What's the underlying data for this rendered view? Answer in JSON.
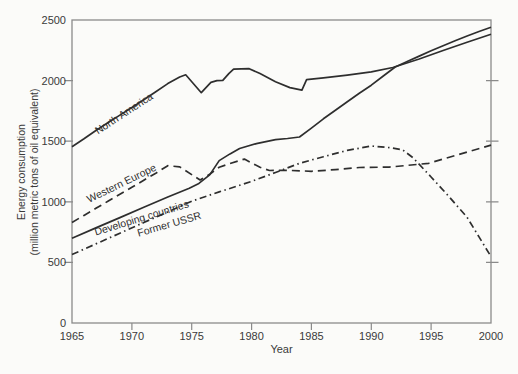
{
  "figure": {
    "background": "#fbfbf9",
    "axis_color": "#8a8a8a",
    "line_color": "#2e2e2e",
    "text_color": "#3a3a3a"
  },
  "chart_data": {
    "type": "line",
    "title": "",
    "xlabel": "Year",
    "ylabel_line1": "Energy consumption",
    "ylabel_line2": "(million metric tons of oil equivalent)",
    "xlim": [
      1965,
      2000
    ],
    "ylim": [
      0,
      2500
    ],
    "x_ticks": [
      1965,
      1970,
      1975,
      1980,
      1985,
      1990,
      1995,
      2000
    ],
    "y_ticks": [
      0,
      500,
      1000,
      1500,
      2000,
      2500
    ],
    "grid": false,
    "legend": "inline-rotated-labels",
    "series": [
      {
        "name": "North America",
        "style": "solid",
        "points": [
          [
            1965,
            1455
          ],
          [
            1966,
            1520
          ],
          [
            1967,
            1588
          ],
          [
            1968,
            1652
          ],
          [
            1969,
            1715
          ],
          [
            1970,
            1778
          ],
          [
            1971,
            1842
          ],
          [
            1972,
            1908
          ],
          [
            1973,
            1975
          ],
          [
            1974,
            2030
          ],
          [
            1974.5,
            2048
          ],
          [
            1975.8,
            1900
          ],
          [
            1976.6,
            1985
          ],
          [
            1977.1,
            2000
          ],
          [
            1977.6,
            2002
          ],
          [
            1978.1,
            2058
          ],
          [
            1978.5,
            2095
          ],
          [
            1979.8,
            2098
          ],
          [
            1980.7,
            2058
          ],
          [
            1982,
            1990
          ],
          [
            1983.2,
            1942
          ],
          [
            1984.2,
            1922
          ],
          [
            1984.6,
            2008
          ],
          [
            1986,
            2022
          ],
          [
            1988,
            2045
          ],
          [
            1990,
            2072
          ],
          [
            1991.8,
            2108
          ],
          [
            1994,
            2178
          ],
          [
            1996,
            2248
          ],
          [
            1998,
            2316
          ],
          [
            2000,
            2382
          ]
        ]
      },
      {
        "name": "Western Europe",
        "style": "dashed",
        "points": [
          [
            1965,
            830
          ],
          [
            1966,
            888
          ],
          [
            1967,
            946
          ],
          [
            1968,
            1004
          ],
          [
            1969,
            1062
          ],
          [
            1970,
            1120
          ],
          [
            1971,
            1178
          ],
          [
            1972,
            1236
          ],
          [
            1973,
            1298
          ],
          [
            1974,
            1288
          ],
          [
            1975.7,
            1180
          ],
          [
            1976.5,
            1228
          ],
          [
            1977.3,
            1285
          ],
          [
            1978.2,
            1316
          ],
          [
            1979.4,
            1352
          ],
          [
            1980.7,
            1285
          ],
          [
            1981.5,
            1258
          ],
          [
            1983,
            1260
          ],
          [
            1985,
            1252
          ],
          [
            1987,
            1266
          ],
          [
            1989,
            1283
          ],
          [
            1991.5,
            1286
          ],
          [
            1993,
            1300
          ],
          [
            1994.8,
            1318
          ],
          [
            1997,
            1382
          ],
          [
            2000,
            1468
          ]
        ]
      },
      {
        "name": "Developing countries",
        "style": "solid",
        "points": [
          [
            1965,
            700
          ],
          [
            1967,
            785
          ],
          [
            1969,
            870
          ],
          [
            1971,
            955
          ],
          [
            1973,
            1040
          ],
          [
            1974.8,
            1112
          ],
          [
            1975.6,
            1152
          ],
          [
            1976.5,
            1222
          ],
          [
            1977.3,
            1340
          ],
          [
            1978.2,
            1395
          ],
          [
            1979,
            1440
          ],
          [
            1980.4,
            1480
          ],
          [
            1982,
            1512
          ],
          [
            1983,
            1522
          ],
          [
            1984,
            1535
          ],
          [
            1985,
            1608
          ],
          [
            1986,
            1685
          ],
          [
            1987,
            1755
          ],
          [
            1988,
            1825
          ],
          [
            1989,
            1895
          ],
          [
            1990,
            1962
          ],
          [
            1991,
            2038
          ],
          [
            1992,
            2112
          ],
          [
            1993,
            2158
          ],
          [
            1994,
            2202
          ],
          [
            1995,
            2246
          ],
          [
            1996,
            2288
          ],
          [
            1997,
            2328
          ],
          [
            1998,
            2368
          ],
          [
            1999,
            2405
          ],
          [
            2000,
            2440
          ]
        ]
      },
      {
        "name": "Former USSR",
        "style": "dashdot",
        "points": [
          [
            1965,
            565
          ],
          [
            1967,
            653
          ],
          [
            1969,
            741
          ],
          [
            1971,
            829
          ],
          [
            1973,
            917
          ],
          [
            1975,
            1005
          ],
          [
            1977.3,
            1082
          ],
          [
            1979,
            1136
          ],
          [
            1980,
            1168
          ],
          [
            1982,
            1242
          ],
          [
            1984,
            1318
          ],
          [
            1986,
            1372
          ],
          [
            1988,
            1424
          ],
          [
            1990,
            1460
          ],
          [
            1991.5,
            1447
          ],
          [
            1992.6,
            1430
          ],
          [
            1993.5,
            1362
          ],
          [
            1995,
            1205
          ],
          [
            1996.5,
            1042
          ],
          [
            1998,
            872
          ],
          [
            1999,
            710
          ],
          [
            2000,
            548
          ]
        ]
      }
    ]
  }
}
